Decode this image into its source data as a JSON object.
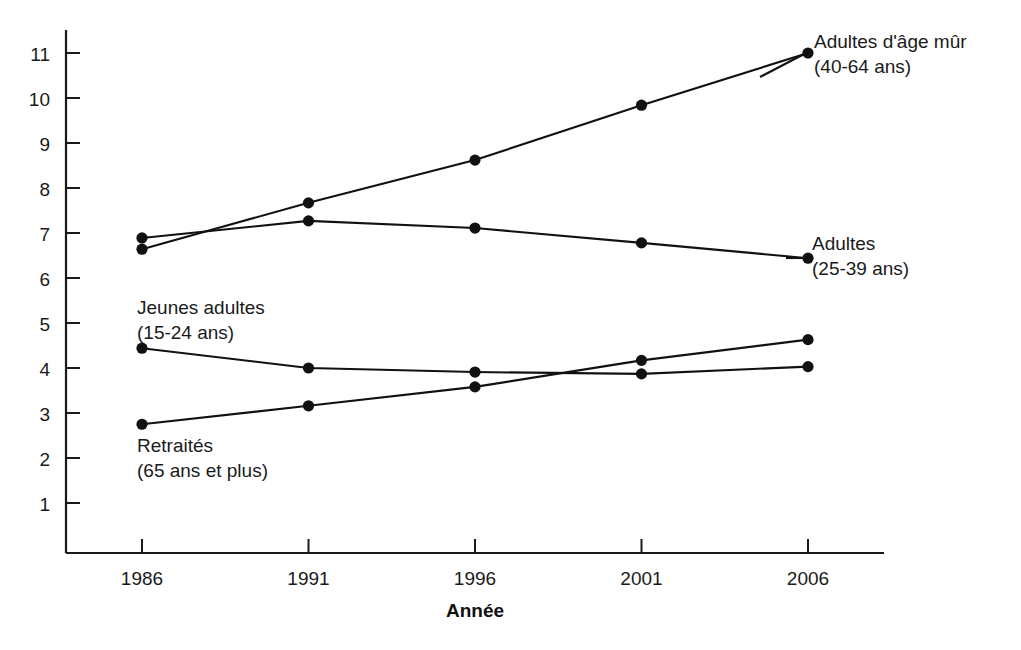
{
  "chart_data": {
    "type": "line",
    "title": "",
    "xlabel": "Année",
    "ylabel": "",
    "categories": [
      "1986",
      "1991",
      "1996",
      "2001",
      "2006"
    ],
    "x": [
      1986,
      1991,
      1996,
      2001,
      2006
    ],
    "xlim": [
      1984.3,
      2008.3
    ],
    "ylim": [
      0,
      11.6
    ],
    "yticks": [
      1,
      2,
      3,
      4,
      5,
      6,
      7,
      8,
      9,
      10,
      11
    ],
    "ytick_labels": [
      "1",
      "2",
      "3",
      "4",
      "5",
      "6",
      "7",
      "8",
      "9",
      "10",
      "11"
    ],
    "grid": false,
    "legend": "inline-annotations",
    "series": [
      {
        "name": "Adultes d'âge mûr",
        "sublabel": "(40-64 ans)",
        "label_line1": "Adultes d'âge mûr",
        "label_line2": "(40-64 ans)",
        "color": "#111111",
        "values": [
          6.64,
          7.67,
          8.62,
          9.84,
          11.0
        ]
      },
      {
        "name": "Adultes",
        "sublabel": "(25-39 ans)",
        "label_line1": "Adultes",
        "label_line2": "(25-39 ans)",
        "color": "#111111",
        "values": [
          6.89,
          7.27,
          7.11,
          6.78,
          6.44
        ]
      },
      {
        "name": "Jeunes adultes",
        "sublabel": "(15-24 ans)",
        "label_line1": "Jeunes adultes",
        "label_line2": "(15-24 ans)",
        "color": "#111111",
        "values": [
          4.44,
          4.0,
          3.91,
          3.87,
          4.03
        ]
      },
      {
        "name": "Retraités",
        "sublabel": "(65 ans et plus)",
        "label_line1": "Retraités",
        "label_line2": "(65 ans et plus)",
        "color": "#111111",
        "values": [
          2.75,
          3.16,
          3.58,
          4.17,
          4.63
        ]
      }
    ]
  },
  "axis": {
    "x_title": "Année",
    "x_tick_labels": [
      "1986",
      "1991",
      "1996",
      "2001",
      "2006"
    ],
    "y_tick_labels": [
      "11",
      "10",
      "9",
      "8",
      "7",
      "6",
      "5",
      "4",
      "3",
      "2",
      "1"
    ]
  },
  "annotations": {
    "mature_adults_line1": "Adultes d'âge mûr",
    "mature_adults_line2": "(40-64 ans)",
    "adults_line1": "Adultes",
    "adults_line2": "(25-39 ans)",
    "young_adults_line1": "Jeunes adultes",
    "young_adults_line2": "(15-24 ans)",
    "retirees_line1": "Retraités",
    "retirees_line2": "(65 ans et plus)"
  },
  "colors": {
    "ink": "#111111",
    "background": "#ffffff"
  }
}
